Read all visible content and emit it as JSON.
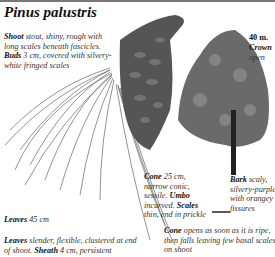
{
  "title": "Pinus palustris",
  "height_label": "40 m.",
  "crown": {
    "term": "Crown",
    "text": "open"
  },
  "shoot": {
    "term": "Shoot",
    "text": " stout, shiny, rough with long scales beneath fascicles."
  },
  "buds": {
    "term": "Buds",
    "text": " 3 cm, covered with silvery-white fringed scales"
  },
  "cone": {
    "term": "Cone",
    "text": " 25 cm, narrow conic, sessile."
  },
  "umbo": {
    "term": "Umbo",
    "text": " incurved."
  },
  "scales": {
    "term": "Scales",
    "text": " thin, end in prickle"
  },
  "bark": {
    "term": "Bark",
    "text": " scaly, silvery-purple with orangey fissures"
  },
  "leaves_size": {
    "term": "Leaves",
    "text": " 45 cm"
  },
  "leaves_desc": {
    "term": "Leaves",
    "text": " slender, flexible, clustered at end of shoot."
  },
  "sheath": {
    "term": "Sheath",
    "text": " 4 cm, persistent"
  },
  "cone_opens": {
    "term": "Cone",
    "text": " opens as soon as it is ripe, then falls leaving few basal scales on shoot"
  }
}
